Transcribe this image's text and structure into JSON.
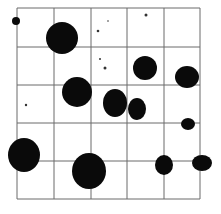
{
  "image": {
    "description": "Colony counting grid (5x5) with dark colonies",
    "width": 221,
    "height": 214,
    "grid": {
      "x_lines": [
        17,
        54,
        91,
        127,
        164,
        200
      ],
      "y_lines": [
        8,
        47,
        85,
        123,
        161,
        199
      ],
      "color": "#6a6a6a"
    },
    "colony_color": "#0a0a0a",
    "colonies": [
      {
        "cx": 16,
        "cy": 21,
        "rx": 4,
        "ry": 4
      },
      {
        "cx": 62,
        "cy": 38,
        "rx": 16,
        "ry": 16
      },
      {
        "cx": 145,
        "cy": 68,
        "rx": 12,
        "ry": 12
      },
      {
        "cx": 187,
        "cy": 77,
        "rx": 12,
        "ry": 11
      },
      {
        "cx": 77,
        "cy": 92,
        "rx": 15,
        "ry": 15
      },
      {
        "cx": 115,
        "cy": 103,
        "rx": 12,
        "ry": 14
      },
      {
        "cx": 137,
        "cy": 109,
        "rx": 9,
        "ry": 11
      },
      {
        "cx": 188,
        "cy": 124,
        "rx": 7,
        "ry": 6
      },
      {
        "cx": 24,
        "cy": 155,
        "rx": 16,
        "ry": 17
      },
      {
        "cx": 89,
        "cy": 171,
        "rx": 17,
        "ry": 18
      },
      {
        "cx": 164,
        "cy": 165,
        "rx": 9,
        "ry": 10
      },
      {
        "cx": 202,
        "cy": 163,
        "rx": 10,
        "ry": 8
      }
    ],
    "specks": [
      {
        "cx": 98,
        "cy": 31,
        "r": 1.3
      },
      {
        "cx": 146,
        "cy": 15,
        "r": 1.5
      },
      {
        "cx": 105,
        "cy": 68,
        "r": 1.5
      },
      {
        "cx": 100,
        "cy": 59,
        "r": 1
      },
      {
        "cx": 26,
        "cy": 105,
        "r": 1.2
      },
      {
        "cx": 108,
        "cy": 21,
        "r": 0.8
      }
    ]
  }
}
